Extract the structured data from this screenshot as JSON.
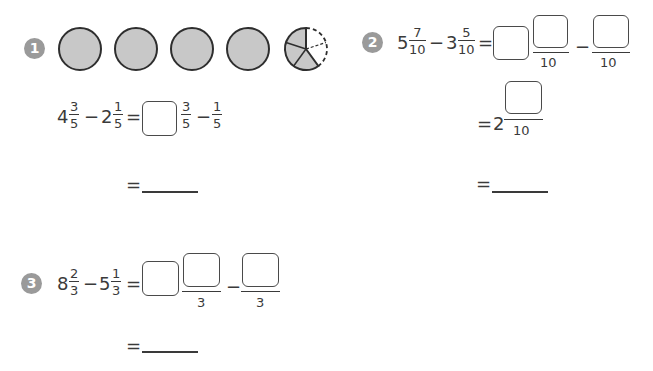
{
  "problems": [
    {
      "number": "1",
      "diagram": {
        "whole_circles": 4,
        "partial_slices_total": 5,
        "partial_slices_shaded": 3,
        "shade_color": "#c8c8c8"
      },
      "equation": {
        "a_whole": "4",
        "a_num": "3",
        "a_den": "5",
        "minus": "−",
        "b_whole": "2",
        "b_num": "1",
        "b_den": "5",
        "equals": "=",
        "r_num1": "3",
        "r_den1": "5",
        "r_num2": "1",
        "r_den2": "5"
      },
      "answer_equals": "="
    },
    {
      "number": "2",
      "equation": {
        "a_whole": "5",
        "a_num": "7",
        "a_den": "10",
        "minus": "−",
        "b_whole": "3",
        "b_num": "5",
        "b_den": "10",
        "equals": "=",
        "r_den1": "10",
        "r_den2": "10"
      },
      "step2": {
        "equals": "=",
        "whole": "2",
        "den": "10"
      },
      "answer_equals": "="
    },
    {
      "number": "3",
      "equation": {
        "a_whole": "8",
        "a_num": "2",
        "a_den": "3",
        "minus": "−",
        "b_whole": "5",
        "b_num": "1",
        "b_den": "3",
        "equals": "=",
        "r_den1": "3",
        "r_den2": "3"
      },
      "answer_equals": "="
    }
  ]
}
